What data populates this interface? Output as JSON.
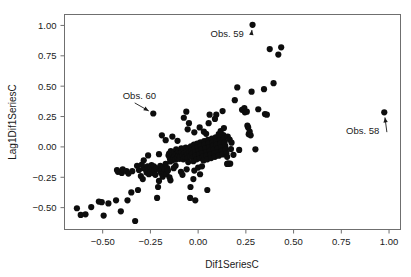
{
  "chart_data": {
    "type": "scatter",
    "title": "",
    "xlabel": "Dif1SeriesC",
    "ylabel": "Lag1Dif1SeriesC",
    "xlim": [
      -0.7,
      1.06
    ],
    "ylim": [
      -0.68,
      1.09
    ],
    "grid": false,
    "legend": "none",
    "marker": {
      "shape": "circle",
      "color": "#0d0d0d",
      "size": 3.1
    },
    "xticks": [
      -0.5,
      -0.25,
      0.0,
      0.25,
      0.5,
      0.75,
      1.0
    ],
    "xticklabels": [
      "-0.50",
      "-0.25",
      "0.00",
      "0.25",
      "0.50",
      "0.75",
      "1.00"
    ],
    "yticks": [
      -0.5,
      -0.25,
      0.0,
      0.25,
      0.5,
      0.75,
      1.0
    ],
    "yticklabels": [
      "-0.50",
      "-0.25",
      "0.00",
      "0.25",
      "0.50",
      "0.75",
      "1.00"
    ],
    "annotations": [
      {
        "text": "Obs. 59",
        "label_x": 0.065,
        "label_y": 0.905,
        "point_x": 0.285,
        "point_y": 1.005,
        "arrow": "up-right"
      },
      {
        "text": "Obs. 60",
        "label_x": -0.395,
        "label_y": 0.395,
        "point_x": -0.235,
        "point_y": 0.275,
        "arrow": "down-right"
      },
      {
        "text": "Obs. 58",
        "label_x": 0.775,
        "label_y": 0.105,
        "point_x": 0.975,
        "point_y": 0.285,
        "arrow": "up-right"
      }
    ],
    "points": [
      [
        -0.635,
        -0.505
      ],
      [
        -0.615,
        -0.56
      ],
      [
        -0.59,
        -0.555
      ],
      [
        -0.56,
        -0.495
      ],
      [
        -0.52,
        -0.45
      ],
      [
        -0.505,
        -0.455
      ],
      [
        -0.495,
        -0.565
      ],
      [
        -0.47,
        -0.465
      ],
      [
        -0.43,
        -0.44
      ],
      [
        -0.425,
        -0.19
      ],
      [
        -0.42,
        -0.205
      ],
      [
        -0.405,
        -0.53
      ],
      [
        -0.4,
        -0.215
      ],
      [
        -0.395,
        -0.185
      ],
      [
        -0.375,
        -0.2
      ],
      [
        -0.37,
        -0.44
      ],
      [
        -0.365,
        -0.22
      ],
      [
        -0.35,
        -0.375
      ],
      [
        -0.345,
        -0.2
      ],
      [
        -0.33,
        -0.61
      ],
      [
        -0.32,
        -0.155
      ],
      [
        -0.315,
        -0.355
      ],
      [
        -0.31,
        -0.19
      ],
      [
        -0.3,
        -0.24
      ],
      [
        -0.295,
        -0.145
      ],
      [
        -0.29,
        -0.265
      ],
      [
        -0.285,
        -0.175
      ],
      [
        -0.275,
        -0.185
      ],
      [
        -0.27,
        -0.21
      ],
      [
        -0.265,
        -0.16
      ],
      [
        -0.262,
        -0.195
      ],
      [
        -0.258,
        -0.225
      ],
      [
        -0.25,
        -0.17
      ],
      [
        -0.248,
        -0.205
      ],
      [
        -0.244,
        -0.15
      ],
      [
        -0.24,
        -0.185
      ],
      [
        -0.236,
        -0.215
      ],
      [
        -0.232,
        -0.16
      ],
      [
        -0.228,
        -0.195
      ],
      [
        -0.224,
        -0.23
      ],
      [
        -0.235,
        0.275
      ],
      [
        -0.22,
        -0.175
      ],
      [
        -0.215,
        -0.42
      ],
      [
        -0.21,
        -0.33
      ],
      [
        -0.205,
        -0.28
      ],
      [
        -0.2,
        -0.195
      ],
      [
        -0.198,
        -0.155
      ],
      [
        -0.194,
        -0.215
      ],
      [
        -0.19,
        -0.18
      ],
      [
        -0.186,
        -0.245
      ],
      [
        -0.182,
        -0.165
      ],
      [
        -0.178,
        -0.205
      ],
      [
        -0.174,
        -0.185
      ],
      [
        -0.17,
        -0.14
      ],
      [
        -0.166,
        -0.225
      ],
      [
        -0.162,
        -0.175
      ],
      [
        -0.158,
        -0.195
      ],
      [
        -0.155,
        -0.07
      ],
      [
        -0.152,
        -0.055
      ],
      [
        -0.148,
        -0.095
      ],
      [
        -0.146,
        -0.12
      ],
      [
        -0.143,
        -0.035
      ],
      [
        -0.14,
        -0.08
      ],
      [
        -0.136,
        -0.11
      ],
      [
        -0.132,
        -0.06
      ],
      [
        -0.128,
        -0.09
      ],
      [
        -0.125,
        -0.045
      ],
      [
        -0.122,
        -0.075
      ],
      [
        -0.118,
        -0.105
      ],
      [
        -0.115,
        -0.02
      ],
      [
        -0.112,
        -0.058
      ],
      [
        -0.108,
        -0.088
      ],
      [
        -0.105,
        -0.038
      ],
      [
        -0.102,
        -0.068
      ],
      [
        -0.098,
        -0.098
      ],
      [
        -0.095,
        -0.048
      ],
      [
        -0.092,
        -0.078
      ],
      [
        -0.088,
        -0.012
      ],
      [
        -0.085,
        -0.042
      ],
      [
        -0.082,
        -0.072
      ],
      [
        -0.078,
        -0.102
      ],
      [
        -0.075,
        -0.022
      ],
      [
        -0.072,
        -0.052
      ],
      [
        -0.068,
        -0.082
      ],
      [
        -0.065,
        -0.005
      ],
      [
        -0.062,
        -0.035
      ],
      [
        -0.058,
        -0.065
      ],
      [
        -0.055,
        -0.095
      ],
      [
        -0.052,
        -0.125
      ],
      [
        -0.048,
        -0.018
      ],
      [
        -0.045,
        -0.048
      ],
      [
        -0.042,
        -0.078
      ],
      [
        -0.038,
        0.005
      ],
      [
        -0.035,
        -0.028
      ],
      [
        -0.032,
        -0.058
      ],
      [
        -0.028,
        -0.088
      ],
      [
        -0.025,
        -0.118
      ],
      [
        -0.022,
        0.018
      ],
      [
        -0.018,
        -0.012
      ],
      [
        -0.015,
        -0.042
      ],
      [
        -0.012,
        -0.072
      ],
      [
        -0.008,
        -0.102
      ],
      [
        -0.005,
        0.028
      ],
      [
        -0.002,
        -0.002
      ],
      [
        0.002,
        -0.032
      ],
      [
        0.005,
        -0.062
      ],
      [
        0.008,
        -0.092
      ],
      [
        0.012,
        0.038
      ],
      [
        0.015,
        0.008
      ],
      [
        0.018,
        -0.022
      ],
      [
        0.022,
        -0.052
      ],
      [
        0.025,
        -0.082
      ],
      [
        0.028,
        -0.112
      ],
      [
        0.032,
        0.048
      ],
      [
        0.035,
        0.018
      ],
      [
        0.038,
        -0.012
      ],
      [
        0.042,
        -0.042
      ],
      [
        0.045,
        -0.072
      ],
      [
        0.048,
        -0.102
      ],
      [
        0.052,
        0.058
      ],
      [
        0.055,
        0.028
      ],
      [
        0.058,
        -0.002
      ],
      [
        0.062,
        -0.032
      ],
      [
        0.065,
        -0.062
      ],
      [
        0.068,
        -0.092
      ],
      [
        0.072,
        0.068
      ],
      [
        0.075,
        0.038
      ],
      [
        0.078,
        0.008
      ],
      [
        0.082,
        -0.022
      ],
      [
        0.085,
        -0.052
      ],
      [
        0.088,
        -0.082
      ],
      [
        0.092,
        0.078
      ],
      [
        0.095,
        0.048
      ],
      [
        0.098,
        0.018
      ],
      [
        0.102,
        -0.012
      ],
      [
        0.105,
        -0.042
      ],
      [
        0.108,
        -0.072
      ],
      [
        0.112,
        0.088
      ],
      [
        0.115,
        0.058
      ],
      [
        0.118,
        0.028
      ],
      [
        0.122,
        -0.002
      ],
      [
        0.125,
        -0.032
      ],
      [
        0.128,
        -0.062
      ],
      [
        0.132,
        0.098
      ],
      [
        0.135,
        0.068
      ],
      [
        0.138,
        0.038
      ],
      [
        0.142,
        0.008
      ],
      [
        0.145,
        -0.022
      ],
      [
        0.148,
        -0.052
      ],
      [
        0.152,
        -0.082
      ],
      [
        0.155,
        -0.138
      ],
      [
        0.16,
        -0.138
      ],
      [
        0.168,
        -0.138
      ],
      [
        -0.108,
        0.05
      ],
      [
        -0.135,
        0.085
      ],
      [
        -0.118,
        -0.155
      ],
      [
        -0.128,
        -0.175
      ],
      [
        -0.15,
        -0.25
      ],
      [
        -0.145,
        -0.275
      ],
      [
        -0.09,
        -0.205
      ],
      [
        -0.082,
        -0.23
      ],
      [
        -0.06,
        -0.185
      ],
      [
        -0.042,
        -0.42
      ],
      [
        -0.04,
        -0.33
      ],
      [
        -0.025,
        -0.265
      ],
      [
        -0.02,
        -0.195
      ],
      [
        0.0,
        -0.17
      ],
      [
        0.01,
        -0.225
      ],
      [
        0.02,
        -0.16
      ],
      [
        -0.075,
        0.24
      ],
      [
        -0.055,
        0.145
      ],
      [
        -0.048,
        0.195
      ],
      [
        -0.02,
        0.12
      ],
      [
        0.008,
        0.16
      ],
      [
        0.03,
        0.125
      ],
      [
        0.055,
        0.195
      ],
      [
        0.06,
        0.265
      ],
      [
        0.095,
        0.265
      ],
      [
        0.108,
        0.105
      ],
      [
        0.118,
        0.13
      ],
      [
        0.135,
        0.155
      ],
      [
        0.155,
        0.085
      ],
      [
        0.165,
        0.06
      ],
      [
        0.172,
        -0.018
      ],
      [
        0.175,
        0.035
      ],
      [
        0.185,
        -0.065
      ],
      [
        0.192,
        0.385
      ],
      [
        0.205,
        0.49
      ],
      [
        0.215,
        -0.025
      ],
      [
        0.23,
        0.305
      ],
      [
        0.242,
        0.32
      ],
      [
        0.245,
        0.285
      ],
      [
        0.255,
        0.29
      ],
      [
        0.258,
        0.175
      ],
      [
        0.262,
        0.16
      ],
      [
        0.265,
        0.105
      ],
      [
        0.27,
        0.125
      ],
      [
        0.275,
        0.095
      ],
      [
        0.28,
        0.455
      ],
      [
        0.285,
        1.005
      ],
      [
        0.3,
        -0.02
      ],
      [
        0.315,
        0.31
      ],
      [
        0.345,
        0.475
      ],
      [
        0.35,
        0.27
      ],
      [
        0.36,
        0.265
      ],
      [
        0.375,
        0.805
      ],
      [
        0.395,
        0.525
      ],
      [
        0.42,
        0.76
      ],
      [
        0.435,
        0.82
      ],
      [
        0.975,
        0.285
      ],
      [
        0.128,
        0.295
      ],
      [
        0.088,
        0.23
      ],
      [
        -0.17,
        0.055
      ],
      [
        -0.19,
        0.095
      ],
      [
        -0.205,
        -0.06
      ],
      [
        -0.262,
        -0.07
      ],
      [
        -0.285,
        -0.11
      ],
      [
        0.048,
        -0.355
      ],
      [
        -0.015,
        -0.44
      ],
      [
        0.152,
        -0.14
      ],
      [
        -0.062,
        0.29
      ],
      [
        0.042,
        0.108
      ]
    ]
  }
}
